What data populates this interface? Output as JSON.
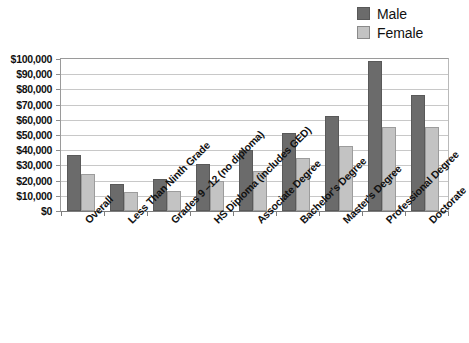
{
  "chart_data": {
    "type": "bar",
    "title": "",
    "xlabel": "",
    "ylabel": "",
    "ylim": [
      0,
      100000
    ],
    "grid": true,
    "legend_position": "top-right",
    "categories": [
      "Overall",
      "Less Than Ninth Grade",
      "Grades 9 –12 (no diploma)",
      "HS Diploma (includes GED)",
      "Associate Degree",
      "Bachelor's Degree",
      "Master's Degree",
      "Professional Degree",
      "Doctorate"
    ],
    "series": [
      {
        "name": "Male",
        "color": "#6b6b6b",
        "values": [
          37000,
          17500,
          21000,
          31000,
          40000,
          51000,
          62500,
          99000,
          76500
        ]
      },
      {
        "name": "Female",
        "color": "#c3c3c3",
        "values": [
          24500,
          12500,
          13000,
          20000,
          26500,
          35000,
          42500,
          55000,
          55000
        ]
      }
    ],
    "ytick_labels": [
      "$100,000",
      "$90,000",
      "$80,000",
      "$70,000",
      "$60,000",
      "$50,000",
      "$40,000",
      "$30,000",
      "$20,000",
      "$10,000",
      "$0"
    ],
    "ytick_values": [
      100000,
      90000,
      80000,
      70000,
      60000,
      50000,
      40000,
      30000,
      20000,
      10000,
      0
    ]
  },
  "legend": {
    "items": [
      {
        "label": "Male",
        "swatch": "male-swatch"
      },
      {
        "label": "Female",
        "swatch": "female-swatch"
      }
    ]
  }
}
